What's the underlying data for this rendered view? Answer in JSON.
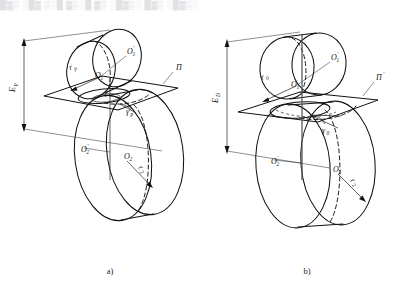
{
  "page": {
    "width": 401,
    "height": 293,
    "background": "#ffffff",
    "ink": "#111111",
    "top_cut_text": "█▓▒ ░█▓ ▒░█ ▓▒░█ ▓▒ ░█▓▒░ █▓▒ ░█▓▒░"
  },
  "figure": {
    "caption_a": "a)",
    "caption_b": "b)"
  },
  "panel_a": {
    "name": "Projection a",
    "labels": {
      "center_upper_prime": "O",
      "center_upper_prime_sub": "1",
      "center_upper_prime_mark": "′",
      "center_upper": "O",
      "center_upper_sub": "1",
      "center_lower_prime": "O",
      "center_lower_prime_sub": "2",
      "center_lower_prime_mark": "′",
      "center_lower": "O",
      "center_lower_sub": "2",
      "radius_small": "r",
      "radius_small_sub": "p",
      "radius_large": "r",
      "radius_large_sub": "2",
      "angle": "γ",
      "angle_sub": "p",
      "plane": "П",
      "dimension": "E",
      "dimension_sub": "p"
    }
  },
  "panel_b": {
    "name": "Projection b",
    "labels": {
      "center_upper_prime": "O",
      "center_upper_prime_sub": "1",
      "center_upper_prime_mark": "′",
      "center_upper": "O",
      "center_upper_sub": "1",
      "center_lower_prime": "O",
      "center_lower_prime_sub": "2",
      "center_lower_prime_mark": "′",
      "center_lower": "O",
      "center_lower_sub": "2",
      "radius_small": "r",
      "radius_small_sub": "0",
      "radius_large": "r",
      "radius_large_sub": "2",
      "angle": "γ",
      "angle_sub": "0",
      "plane": "П",
      "plane_mark": "′",
      "dimension": "E",
      "dimension_sub": "D"
    }
  }
}
